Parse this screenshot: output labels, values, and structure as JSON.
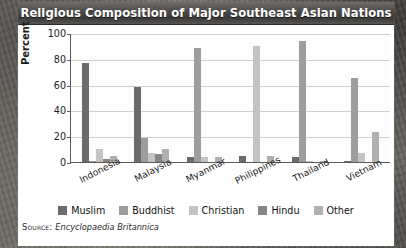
{
  "figure": {
    "title": "Religious Composition of Major Southeast Asian Nations",
    "source_label": "Source:",
    "source_text": "Encyclopaedia Britannica"
  },
  "colors": {
    "muslim": "#6b6b6b",
    "buddhist": "#9d9d9d",
    "christian": "#c3c3c3",
    "hindu": "#868686",
    "other": "#b0b0b0",
    "axis": "#5c5a58",
    "grid": "#cfcfcf",
    "title_text": "#ffffff"
  },
  "chart_data": {
    "type": "bar",
    "title": "Religious Composition of Major Southeast Asian Nations",
    "xlabel": "",
    "ylabel": "Percent",
    "ylim": [
      0,
      100
    ],
    "yticks": [
      100,
      80,
      60,
      40,
      20,
      0
    ],
    "grid": true,
    "legend_position": "bottom",
    "categories": [
      "Indonesia",
      "Malaysia",
      "Myanmar",
      "Philippines",
      "Thailand",
      "Vietnam"
    ],
    "series": [
      {
        "name": "Muslim",
        "values": [
          77,
          58,
          4,
          5,
          4,
          1
        ]
      },
      {
        "name": "Buddhist",
        "values": [
          1,
          19,
          88,
          0,
          94,
          65
        ]
      },
      {
        "name": "Christian",
        "values": [
          10,
          7,
          4,
          90,
          1,
          7
        ]
      },
      {
        "name": "Hindu",
        "values": [
          2,
          6,
          0,
          0,
          0,
          0
        ]
      },
      {
        "name": "Other",
        "values": [
          5,
          10,
          4,
          5,
          1,
          23
        ]
      }
    ]
  }
}
